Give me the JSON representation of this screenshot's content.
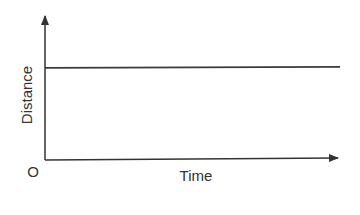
{
  "chart_data": {
    "type": "line",
    "title": "",
    "xlabel": "Time",
    "ylabel": "Distance",
    "origin_label": "O",
    "xlim": [
      0,
      1
    ],
    "ylim": [
      0,
      1
    ],
    "grid": false,
    "series": [
      {
        "name": "distance",
        "x": [
          0,
          1
        ],
        "y": [
          0.64,
          0.64
        ]
      }
    ]
  },
  "colors": {
    "axis": "#333333",
    "line": "#3a3a3a"
  }
}
